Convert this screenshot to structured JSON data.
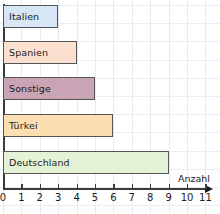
{
  "chart_data": {
    "type": "bar",
    "orientation": "horizontal",
    "title": "",
    "xlabel": "Anzahl",
    "ylabel": "",
    "categories": [
      "Italien",
      "Spanien",
      "Sonstige",
      "Türkei",
      "Deutschland"
    ],
    "values": [
      3,
      4,
      5,
      6,
      9
    ],
    "xlim": [
      0,
      11
    ],
    "xticks": [
      "0",
      "1",
      "2",
      "3",
      "4",
      "5",
      "6",
      "7",
      "8",
      "9",
      "10",
      "11"
    ],
    "grid": true,
    "legend": "none",
    "bar_colors": [
      "#d6e6f4",
      "#fbe0cf",
      "#c9a4b4",
      "#fbdfb0",
      "#e4f2d6"
    ],
    "bar_border_color": "#555555"
  },
  "axis": {
    "x_title": "Anzahl",
    "arrow_icon": "right-arrow-icon"
  },
  "bars": [
    {
      "label": "Italien",
      "value": 3,
      "color": "#d6e6f4"
    },
    {
      "label": "Spanien",
      "value": 4,
      "color": "#fbe0cf"
    },
    {
      "label": "Sonstige",
      "value": 5,
      "color": "#c9a4b4"
    },
    {
      "label": "Türkei",
      "value": 6,
      "color": "#fbdfb0"
    },
    {
      "label": "Deutschland",
      "value": 9,
      "color": "#e4f2d6"
    }
  ],
  "ticks": [
    {
      "label": "0"
    },
    {
      "label": "1"
    },
    {
      "label": "2"
    },
    {
      "label": "3"
    },
    {
      "label": "4"
    },
    {
      "label": "5"
    },
    {
      "label": "6"
    },
    {
      "label": "7"
    },
    {
      "label": "8"
    },
    {
      "label": "9"
    },
    {
      "label": "10"
    },
    {
      "label": "11"
    }
  ]
}
